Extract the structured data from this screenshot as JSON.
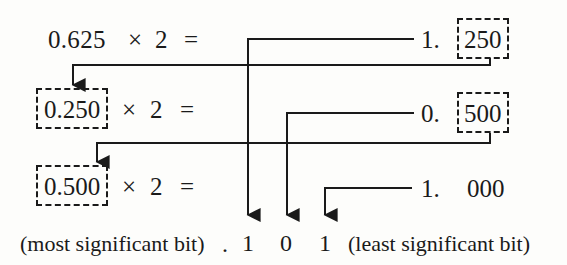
{
  "figure": {
    "ink_color": "#1a1a1a",
    "background_color": "#fdfdfb"
  },
  "rows": [
    {
      "id": "row-1",
      "operand": "0.625",
      "multiply_symbol": "×",
      "multiplier": "2",
      "equals": "=",
      "integer_part": "1.",
      "fraction_part": "250",
      "operand_boxed": false,
      "fraction_boxed": true
    },
    {
      "id": "row-2",
      "operand": "0.250",
      "multiply_symbol": "×",
      "multiplier": "2",
      "equals": "=",
      "integer_part": "0.",
      "fraction_part": "500",
      "operand_boxed": true,
      "fraction_boxed": true
    },
    {
      "id": "row-3",
      "operand": "0.500",
      "multiply_symbol": "×",
      "multiplier": "2",
      "equals": "=",
      "integer_part": "1.",
      "fraction_part": "000",
      "operand_boxed": true,
      "fraction_boxed": false
    }
  ],
  "result": {
    "msb_label": "(most significant bit)",
    "radix_point": ".",
    "bits": [
      "1",
      "0",
      "1"
    ],
    "lsb_label": "(least significant bit)"
  },
  "annotations": {
    "arrow_down_icon": "arrow-down",
    "feedback_arrow_icon": "arrow-down",
    "wire_icon": "elbow-connector"
  }
}
